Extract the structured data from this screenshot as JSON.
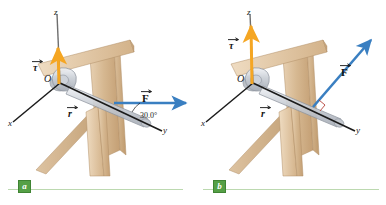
{
  "figure": {
    "background_color": "#ffffff"
  },
  "colors": {
    "torque_arrow": "#f5a623",
    "force_arrow": "#3a7fc1",
    "axis_line": "#1b1b1b",
    "z_axis_line": "#6e6e6e",
    "wrench_body": "#c9cdd4",
    "wrench_outline": "#8e949e",
    "wood_light": "#e3c9a8",
    "wood_mid": "#d4b48c",
    "wood_dark": "#c09c72",
    "bolt": "#9aa0a8",
    "caption_rule": "#bcd9b0",
    "caption_badge": "#55a046",
    "right_angle_mark": "#b4423a"
  },
  "panels": [
    {
      "id": "a",
      "caption_letter": "a",
      "axes": {
        "x_label": "x",
        "y_label": "y",
        "z_label": "z"
      },
      "origin_label": "O",
      "vectors": [
        {
          "name": "torque",
          "symbol": "τ",
          "color": "#f5a623",
          "direction": "up along z"
        },
        {
          "name": "position",
          "symbol": "r",
          "color": "#121212",
          "direction": "along wrench toward y"
        },
        {
          "name": "force",
          "symbol": "F",
          "color": "#3a7fc1",
          "direction": "horizontal to the right"
        }
      ],
      "angle": {
        "label": "30.0°",
        "between": "F and y axis"
      }
    },
    {
      "id": "b",
      "caption_letter": "b",
      "axes": {
        "x_label": "x",
        "y_label": "y",
        "z_label": "z"
      },
      "origin_label": "O",
      "vectors": [
        {
          "name": "torque",
          "symbol": "τ",
          "color": "#f5a623",
          "direction": "up along z, longer"
        },
        {
          "name": "position",
          "symbol": "r",
          "color": "#121212",
          "direction": "along wrench toward y"
        },
        {
          "name": "force",
          "symbol": "F",
          "color": "#3a7fc1",
          "direction": "perpendicular to wrench, up and to the right"
        }
      ],
      "angle": {
        "label": "",
        "between": "right angle marker between F and wrench"
      }
    }
  ]
}
